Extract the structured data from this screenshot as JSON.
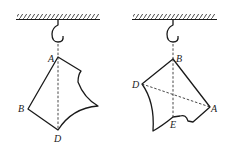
{
  "figures": [
    {
      "id": "left",
      "labels": {
        "A": "A",
        "B": "B",
        "D": "D"
      }
    },
    {
      "id": "right",
      "labels": {
        "A": "A",
        "B": "B",
        "D": "D",
        "E": "E"
      }
    }
  ],
  "colors": {
    "stroke": "#1a1a1a",
    "background": "#ffffff"
  }
}
